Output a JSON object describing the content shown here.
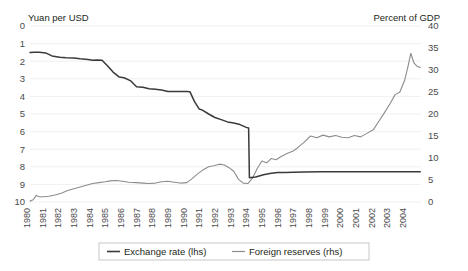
{
  "chart_data": {
    "type": "line",
    "title": "",
    "left_axis": {
      "label": "Yuan per USD",
      "ticks": [
        0,
        1,
        2,
        3,
        4,
        5,
        6,
        7,
        8,
        9,
        10
      ],
      "ylim": [
        0,
        10
      ],
      "inverted": true
    },
    "right_axis": {
      "label": "Percent of GDP",
      "ticks": [
        0,
        5,
        10,
        15,
        20,
        25,
        30,
        35,
        40
      ],
      "ylim": [
        0,
        40
      ],
      "inverted": false
    },
    "xlabel": "",
    "grid": true,
    "legend_position": "bottom",
    "x": [
      1980,
      1981,
      1982,
      1983,
      1984,
      1985,
      1986,
      1987,
      1988,
      1989,
      1990,
      1991,
      1992,
      1993,
      1994,
      1995,
      1996,
      1997,
      1998,
      1999,
      2000,
      2001,
      2002,
      2003,
      2004
    ],
    "categories": [
      "1980",
      "1981",
      "1982",
      "1983",
      "1984",
      "1985",
      "1986",
      "1987",
      "1988",
      "1989",
      "1990",
      "1991",
      "1992",
      "1993",
      "1994",
      "1995",
      "1996",
      "1997",
      "1998",
      "1999",
      "2000",
      "2001",
      "2002",
      "2003",
      "2004"
    ],
    "series": [
      {
        "name": "Exchange rate (lhs)",
        "axis": "left",
        "units": "Yuan per USD",
        "color": "#3a3a3a",
        "values": [
          1.5,
          1.7,
          1.89,
          1.98,
          2.32,
          2.94,
          3.45,
          3.72,
          3.72,
          3.77,
          4.78,
          5.32,
          5.51,
          5.76,
          8.62,
          8.35,
          8.31,
          8.29,
          8.28,
          8.28,
          8.28,
          8.28,
          8.28,
          8.28,
          8.28
        ]
      },
      {
        "name": "Foreign reserves (rhs)",
        "axis": "right",
        "units": "Percent of GDP",
        "color": "#8c8c8c",
        "values": [
          0.2,
          1.3,
          2.6,
          3.5,
          4.4,
          4.7,
          4.4,
          4.2,
          4.5,
          4.3,
          5.9,
          8.6,
          7.0,
          4.2,
          9.3,
          11.0,
          13.6,
          15.0,
          14.8,
          15.0,
          14.8,
          18.0,
          22.5,
          30.5,
          32.0
        ]
      }
    ],
    "monthly_detail": {
      "note": "series are drawn at monthly resolution between annual ticks",
      "exchange_rate_left": [
        [
          1980.0,
          1.5
        ],
        [
          1980.3,
          1.49
        ],
        [
          1980.6,
          1.49
        ],
        [
          1981.0,
          1.53
        ],
        [
          1981.4,
          1.7
        ],
        [
          1981.9,
          1.77
        ],
        [
          1982.3,
          1.8
        ],
        [
          1982.8,
          1.82
        ],
        [
          1983.2,
          1.86
        ],
        [
          1983.7,
          1.9
        ],
        [
          1984.0,
          1.94
        ],
        [
          1984.3,
          1.93
        ],
        [
          1984.6,
          1.95
        ],
        [
          1985.0,
          2.32
        ],
        [
          1985.3,
          2.62
        ],
        [
          1985.7,
          2.9
        ],
        [
          1986.0,
          2.94
        ],
        [
          1986.4,
          3.1
        ],
        [
          1986.8,
          3.45
        ],
        [
          1987.2,
          3.48
        ],
        [
          1987.6,
          3.56
        ],
        [
          1988.0,
          3.6
        ],
        [
          1988.4,
          3.64
        ],
        [
          1988.8,
          3.72
        ],
        [
          1989.0,
          3.72
        ],
        [
          1989.5,
          3.72
        ],
        [
          1990.0,
          3.72
        ],
        [
          1990.2,
          3.73
        ],
        [
          1990.5,
          4.3
        ],
        [
          1990.8,
          4.72
        ],
        [
          1991.0,
          4.78
        ],
        [
          1991.4,
          5.0
        ],
        [
          1991.8,
          5.2
        ],
        [
          1992.2,
          5.32
        ],
        [
          1992.6,
          5.45
        ],
        [
          1993.0,
          5.51
        ],
        [
          1993.4,
          5.6
        ],
        [
          1993.8,
          5.76
        ],
        [
          1993.95,
          5.8
        ],
        [
          1994.0,
          8.62
        ],
        [
          1994.4,
          8.58
        ],
        [
          1994.9,
          8.45
        ],
        [
          1995.3,
          8.38
        ],
        [
          1995.8,
          8.33
        ],
        [
          1996.3,
          8.32
        ],
        [
          1996.8,
          8.31
        ],
        [
          1997.5,
          8.29
        ],
        [
          1998.5,
          8.28
        ],
        [
          2000.0,
          8.28
        ],
        [
          2002.0,
          8.28
        ],
        [
          2004.0,
          8.28
        ],
        [
          2004.9,
          8.28
        ]
      ],
      "foreign_reserves_right": [
        [
          1980.0,
          0.2
        ],
        [
          1980.2,
          0.5
        ],
        [
          1980.4,
          1.5
        ],
        [
          1980.6,
          1.2
        ],
        [
          1980.9,
          1.2
        ],
        [
          1981.2,
          1.3
        ],
        [
          1981.6,
          1.6
        ],
        [
          1982.0,
          2.0
        ],
        [
          1982.4,
          2.6
        ],
        [
          1982.8,
          3.0
        ],
        [
          1983.2,
          3.4
        ],
        [
          1983.6,
          3.8
        ],
        [
          1984.0,
          4.2
        ],
        [
          1984.4,
          4.4
        ],
        [
          1984.8,
          4.6
        ],
        [
          1985.1,
          4.8
        ],
        [
          1985.5,
          4.9
        ],
        [
          1985.9,
          4.7
        ],
        [
          1986.3,
          4.5
        ],
        [
          1986.8,
          4.4
        ],
        [
          1987.2,
          4.3
        ],
        [
          1987.6,
          4.2
        ],
        [
          1988.0,
          4.3
        ],
        [
          1988.4,
          4.6
        ],
        [
          1988.8,
          4.7
        ],
        [
          1989.2,
          4.5
        ],
        [
          1989.6,
          4.3
        ],
        [
          1990.0,
          4.4
        ],
        [
          1990.3,
          5.2
        ],
        [
          1990.7,
          6.4
        ],
        [
          1991.0,
          7.2
        ],
        [
          1991.4,
          8.0
        ],
        [
          1991.8,
          8.3
        ],
        [
          1992.1,
          8.6
        ],
        [
          1992.4,
          8.4
        ],
        [
          1992.7,
          7.8
        ],
        [
          1993.0,
          7.0
        ],
        [
          1993.3,
          5.2
        ],
        [
          1993.6,
          4.3
        ],
        [
          1993.9,
          4.2
        ],
        [
          1994.2,
          5.4
        ],
        [
          1994.5,
          7.6
        ],
        [
          1994.8,
          9.3
        ],
        [
          1995.1,
          8.9
        ],
        [
          1995.4,
          9.9
        ],
        [
          1995.7,
          9.6
        ],
        [
          1996.0,
          10.3
        ],
        [
          1996.4,
          11.0
        ],
        [
          1996.8,
          11.6
        ],
        [
          1997.1,
          12.4
        ],
        [
          1997.5,
          13.6
        ],
        [
          1997.9,
          15.0
        ],
        [
          1998.3,
          14.6
        ],
        [
          1998.7,
          15.2
        ],
        [
          1999.1,
          14.8
        ],
        [
          1999.5,
          15.1
        ],
        [
          1999.9,
          14.7
        ],
        [
          2000.3,
          14.6
        ],
        [
          2000.7,
          15.1
        ],
        [
          2001.1,
          14.8
        ],
        [
          2001.5,
          15.6
        ],
        [
          2001.9,
          16.4
        ],
        [
          2002.2,
          18.0
        ],
        [
          2002.6,
          20.2
        ],
        [
          2003.0,
          22.5
        ],
        [
          2003.3,
          24.4
        ],
        [
          2003.6,
          25.0
        ],
        [
          2003.9,
          27.6
        ],
        [
          2004.1,
          30.5
        ],
        [
          2004.3,
          33.8
        ],
        [
          2004.5,
          31.6
        ],
        [
          2004.7,
          30.8
        ],
        [
          2004.9,
          30.6
        ]
      ]
    },
    "annotations": [
      {
        "text": "1994 devaluation: exchange rate jumps from 5.8 to 8.7 yuan per USD",
        "x": 1994
      }
    ]
  },
  "legend": {
    "items": [
      {
        "label": "Exchange rate (lhs)",
        "color": "#3a3a3a"
      },
      {
        "label": "Foreign reserves (rhs)",
        "color": "#8c8c8c"
      }
    ]
  }
}
